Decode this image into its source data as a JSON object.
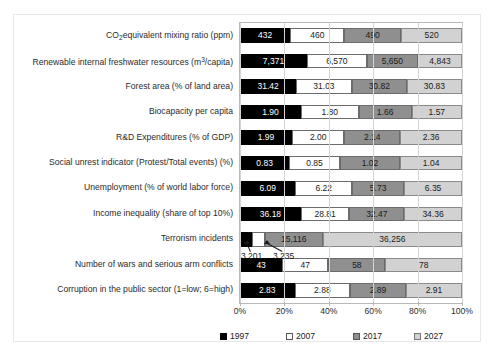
{
  "chart_data": {
    "type": "bar",
    "subtype": "100% stacked horizontal bar",
    "title": "",
    "xlabel": "",
    "ylabel": "",
    "xlim": [
      0,
      100
    ],
    "xticks": [
      "0%",
      "20%",
      "40%",
      "60%",
      "80%",
      "100%"
    ],
    "grid": true,
    "legend_position": "bottom",
    "legend": [
      "1997",
      "2007",
      "2017",
      "2027"
    ],
    "colors": {
      "1997": "#000000",
      "2007": "#ffffff",
      "2017": "#8f8f8f",
      "2027": "#d2d2d2"
    },
    "categories": [
      "CO2 equivalent mixing ratio (ppm)",
      "Renewable internal freshwater resources (m3/capita)",
      "Forest area (% of land area)",
      "Biocapacity per capita",
      "R&D Expenditures (% of GDP)",
      "Social unrest indicator (Protest/Total events) (%)",
      "Unemployment  (% of world labor force)",
      "Income inequality (share of top 10%)",
      "Terrorism incidents",
      "Number of wars and serious arm conflicts",
      "Corruption in the public sector (1=low; 6=high)"
    ],
    "series": [
      {
        "name": "1997",
        "values": [
          432,
          7371,
          31.42,
          1.9,
          1.99,
          0.83,
          6.09,
          36.18,
          3201,
          43,
          2.83
        ],
        "labels": [
          "432",
          "7,371",
          "31.42",
          "1.90",
          "1.99",
          "0.83",
          "6.09",
          "36.18",
          "3,201",
          "43",
          "2.83"
        ]
      },
      {
        "name": "2007",
        "values": [
          460,
          6570,
          31.03,
          1.8,
          2.0,
          0.85,
          6.22,
          28.81,
          3235,
          47,
          2.88
        ],
        "labels": [
          "460",
          "6,570",
          "31.03",
          "1.80",
          "2.00",
          "0.85",
          "6.22",
          "28.81",
          "3,235",
          "47",
          "2.88"
        ]
      },
      {
        "name": "2017",
        "values": [
          490,
          5650,
          30.82,
          1.66,
          2.14,
          1.02,
          5.73,
          32.47,
          15116,
          58,
          2.89
        ],
        "labels": [
          "490",
          "5,650",
          "30.82",
          "1.66",
          "2.14",
          "1.02",
          "5.73",
          "32.47",
          "15,116",
          "58",
          "2.89"
        ]
      },
      {
        "name": "2027",
        "values": [
          520,
          4843,
          30.83,
          1.57,
          2.36,
          1.04,
          6.35,
          34.36,
          36256,
          78,
          2.91
        ],
        "labels": [
          "520",
          "4,843",
          "30.83",
          "1.57",
          "2.36",
          "1.04",
          "6.35",
          "34.36",
          "36,256",
          "78",
          "2.91"
        ]
      }
    ],
    "annotations": [
      {
        "text": "3,201",
        "refers_to": "Terrorism incidents / 1997"
      },
      {
        "text": "3,235",
        "refers_to": "Terrorism incidents / 2007"
      }
    ]
  },
  "category_labels_html": [
    "CO<sub>2</sub>equivalent mixing ratio (ppm)",
    "Renewable internal freshwater resources (m<sup>3</sup>/capita)",
    "Forest area (% of land area)",
    "Biocapacity per capita",
    "R&amp;D Expenditures (% of GDP)",
    "Social unrest indicator (Protest/Total events) (%)",
    "Unemployment  (% of world labor force)",
    "Income inequality (share of top 10%)",
    "Terrorism incidents",
    "Number of wars and serious arm conflicts",
    "Corruption in the public sector (1=low; 6=high)"
  ]
}
